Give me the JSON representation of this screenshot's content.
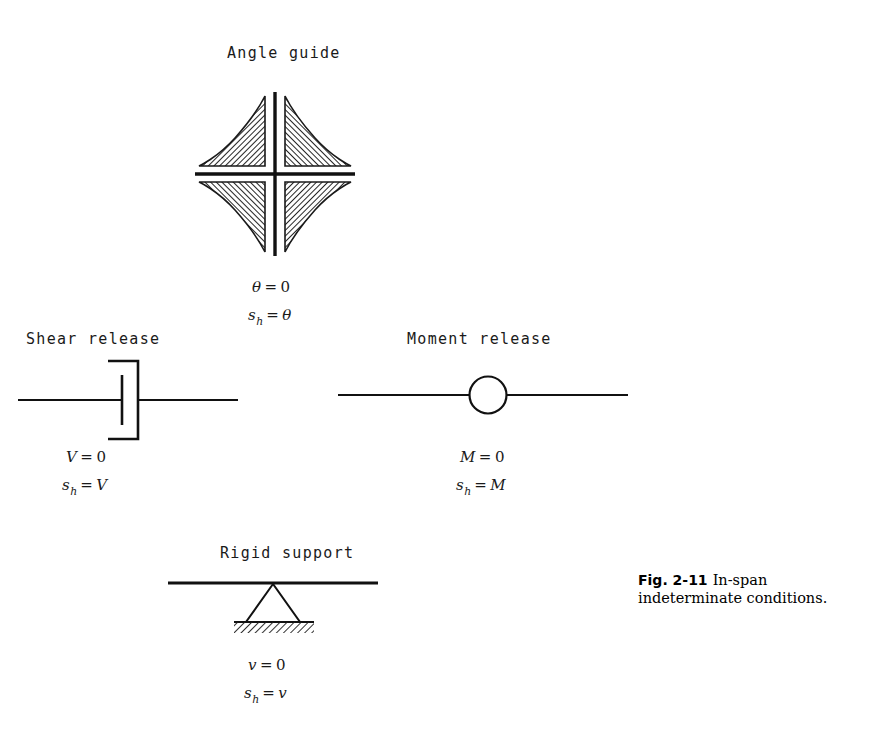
{
  "figure": {
    "caption_label": "Fig. 2-11",
    "caption_text": "In-span indeterminate conditions."
  },
  "sections": {
    "angle_guide": {
      "title": "Angle guide",
      "symbol_name": "angle-guide-symbol",
      "equations": [
        {
          "lhs": "θ",
          "op": "=",
          "rhs": "0"
        },
        {
          "lhs": "s",
          "sub": "h",
          "op": "=",
          "rhs": "θ"
        }
      ]
    },
    "shear_release": {
      "title": "Shear release",
      "symbol_name": "shear-release-symbol",
      "equations": [
        {
          "lhs": "V",
          "op": "=",
          "rhs": "0"
        },
        {
          "lhs": "s",
          "sub": "h",
          "op": "=",
          "rhs": "V"
        }
      ]
    },
    "moment_release": {
      "title": "Moment release",
      "symbol_name": "moment-release-symbol",
      "equations": [
        {
          "lhs": "M",
          "op": "=",
          "rhs": "0"
        },
        {
          "lhs": "s",
          "sub": "h",
          "op": "=",
          "rhs": "M"
        }
      ]
    },
    "rigid_support": {
      "title": "Rigid support",
      "symbol_name": "rigid-support-symbol",
      "equations": [
        {
          "lhs": "v",
          "op": "=",
          "rhs": "0"
        },
        {
          "lhs": "s",
          "sub": "h",
          "op": "=",
          "rhs": "v"
        }
      ]
    }
  },
  "eq_text": {
    "angle_1_lhs": "θ",
    "angle_1_op": "=",
    "angle_1_rhs": "0",
    "angle_2_lhs": "s",
    "angle_2_sub": "h",
    "angle_2_op": "=",
    "angle_2_rhs": "θ",
    "shear_1_lhs": "V",
    "shear_1_op": "=",
    "shear_1_rhs": "0",
    "shear_2_lhs": "s",
    "shear_2_sub": "h",
    "shear_2_op": "=",
    "shear_2_rhs": "V",
    "moment_1_lhs": "M",
    "moment_1_op": "=",
    "moment_1_rhs": "0",
    "moment_2_lhs": "s",
    "moment_2_sub": "h",
    "moment_2_op": "=",
    "moment_2_rhs": "M",
    "rigid_1_lhs": "v",
    "rigid_1_op": "=",
    "rigid_1_rhs": "0",
    "rigid_2_lhs": "s",
    "rigid_2_sub": "h",
    "rigid_2_op": "=",
    "rigid_2_rhs": "v"
  },
  "colors": {
    "ink": "#111111",
    "background": "#ffffff",
    "hatch": "#1a1a1a"
  }
}
